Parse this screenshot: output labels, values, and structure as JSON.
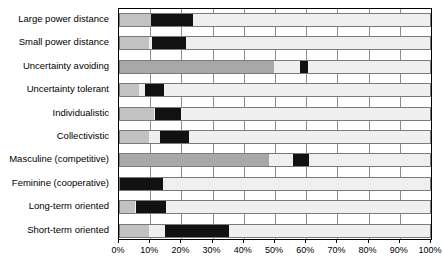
{
  "chart_data": {
    "type": "bar",
    "orientation": "horizontal",
    "stacked": true,
    "title": "",
    "subtitle": "",
    "xlabel": "",
    "ylabel": "",
    "xlim": [
      0,
      100
    ],
    "grid": true,
    "legend": "none",
    "xticks": [
      "0%",
      "10%",
      "20%",
      "30%",
      "40%",
      "50%",
      "60%",
      "70%",
      "80%",
      "90%",
      "100%"
    ],
    "xtick_values": [
      0,
      10,
      20,
      30,
      40,
      50,
      60,
      70,
      80,
      90,
      100
    ],
    "categories": [
      "Large power distance",
      "Small power distance",
      "Uncertainty avoiding",
      "Uncertainty tolerant",
      "Individualistic",
      "Collectivistic",
      "Masculine (competitive)",
      "Feminine (cooperative)",
      "Long-term oriented",
      "Short-term oriented"
    ],
    "series": [
      {
        "name": "gray-segment",
        "color": "#c2c2c2",
        "values": [
          10.0,
          9.3,
          49.4,
          6.0,
          10.8,
          9.4,
          47.8,
          0.0,
          4.8,
          9.4
        ]
      },
      {
        "name": "black-segment",
        "color": "#111111",
        "starts": [
          10.0,
          10.3,
          57.7,
          8.0,
          11.3,
          12.9,
          55.4,
          0.0,
          5.1,
          14.4
        ],
        "ends": [
          23.5,
          21.0,
          60.3,
          14.0,
          19.6,
          22.2,
          60.7,
          13.8,
          14.7,
          35.0
        ]
      }
    ],
    "bars": [
      {
        "label": "Large power distance",
        "gray_end": 10.0,
        "black_start": 10.0,
        "black_end": 23.5,
        "gray_style": "light"
      },
      {
        "label": "Small power distance",
        "gray_end": 9.3,
        "black_start": 10.3,
        "black_end": 21.0,
        "gray_style": "light"
      },
      {
        "label": "Uncertainty avoiding",
        "gray_end": 49.4,
        "black_start": 57.7,
        "black_end": 60.3,
        "gray_style": "dark"
      },
      {
        "label": "Uncertainty tolerant",
        "gray_end": 6.0,
        "black_start": 8.0,
        "black_end": 14.0,
        "gray_style": "light"
      },
      {
        "label": "Individualistic",
        "gray_end": 10.8,
        "black_start": 11.3,
        "black_end": 19.6,
        "gray_style": "light"
      },
      {
        "label": "Collectivistic",
        "gray_end": 9.4,
        "black_start": 12.9,
        "black_end": 22.2,
        "gray_style": "light"
      },
      {
        "label": "Masculine (competitive)",
        "gray_end": 47.8,
        "black_start": 55.4,
        "black_end": 60.7,
        "gray_style": "dark"
      },
      {
        "label": "Feminine (cooperative)",
        "gray_end": 0.0,
        "black_start": 0.0,
        "black_end": 13.8,
        "gray_style": "light"
      },
      {
        "label": "Long-term oriented",
        "gray_end": 4.8,
        "black_start": 5.1,
        "black_end": 14.7,
        "gray_style": "light"
      },
      {
        "label": "Short-term oriented",
        "gray_end": 9.4,
        "black_start": 14.4,
        "black_end": 35.0,
        "gray_style": "light"
      }
    ],
    "colors": {
      "track": "#efefef",
      "light_gray": "#c2c2c2",
      "dark_gray": "#a8a8a8",
      "black": "#111111",
      "gridline": "#8c8c8c",
      "frame": "#000000"
    }
  }
}
